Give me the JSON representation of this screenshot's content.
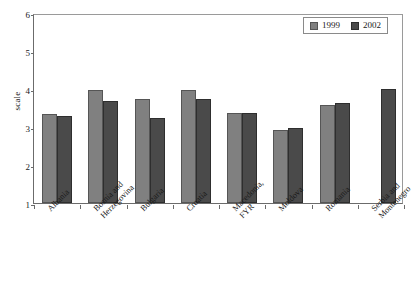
{
  "chart_data": {
    "type": "bar",
    "title": "",
    "xlabel": "",
    "ylabel": "scale",
    "ylim": [
      1,
      6
    ],
    "yticks": [
      1,
      2,
      3,
      4,
      5,
      6
    ],
    "grid": false,
    "legend_position": "top-right",
    "categories": [
      "Albania",
      "Bosnia and Herzegovina",
      "Bulgaria",
      "Croatia",
      "Macedonia, FYR",
      "Moldova",
      "Romania",
      "Serbia and Montenegro"
    ],
    "category_lines": [
      [
        "Albania",
        ""
      ],
      [
        "Bosnia and",
        "Herzegovina"
      ],
      [
        "Bulgaria",
        ""
      ],
      [
        "Croatia",
        ""
      ],
      [
        "Macedonia,",
        "FYR"
      ],
      [
        "Moldova",
        ""
      ],
      [
        "Romania",
        ""
      ],
      [
        "Serbia and",
        "Montenegro"
      ]
    ],
    "series": [
      {
        "name": "1999",
        "color": "#808080",
        "values": [
          3.33,
          3.97,
          3.75,
          3.97,
          3.37,
          2.93,
          3.57,
          null
        ]
      },
      {
        "name": "2002",
        "color": "#4a4a4a",
        "values": [
          3.3,
          3.68,
          3.23,
          3.75,
          3.37,
          2.97,
          3.62,
          4.0
        ]
      }
    ]
  },
  "legend": {
    "items": [
      {
        "label": "1999",
        "color": "#808080"
      },
      {
        "label": "2002",
        "color": "#4a4a4a"
      }
    ]
  },
  "axes": {
    "y_label": "scale",
    "y_tick_labels": [
      "6",
      "5",
      "4",
      "3",
      "2",
      "1"
    ]
  }
}
